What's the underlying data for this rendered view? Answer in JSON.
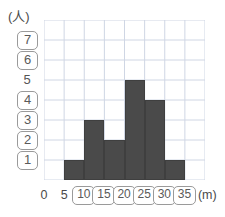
{
  "axes": {
    "y_unit_label": "(人)",
    "x_unit_label": "(m)",
    "y_ticks": [
      {
        "label": "7",
        "value": 7,
        "boxed": true
      },
      {
        "label": "6",
        "value": 6,
        "boxed": true
      },
      {
        "label": "5",
        "value": 5,
        "boxed": false
      },
      {
        "label": "4",
        "value": 4,
        "boxed": true
      },
      {
        "label": "3",
        "value": 3,
        "boxed": true
      },
      {
        "label": "2",
        "value": 2,
        "boxed": true
      },
      {
        "label": "1",
        "value": 1,
        "boxed": true
      }
    ],
    "x_ticks": [
      {
        "label": "0",
        "value": 0,
        "boxed": false
      },
      {
        "label": "5",
        "value": 5,
        "boxed": false
      },
      {
        "label": "10",
        "value": 10,
        "boxed": true
      },
      {
        "label": "15",
        "value": 15,
        "boxed": true
      },
      {
        "label": "20",
        "value": 20,
        "boxed": true
      },
      {
        "label": "25",
        "value": 25,
        "boxed": true
      },
      {
        "label": "30",
        "value": 30,
        "boxed": true
      },
      {
        "label": "35",
        "value": 35,
        "boxed": true
      }
    ]
  },
  "colors": {
    "bar_fill": "#4a4a4a",
    "bar_stroke": "#3f3f3f",
    "grid_line": "#cfd6e4",
    "label_box_border": "#9a9a9a",
    "text": "#4a4a4a",
    "background": "#ffffff"
  },
  "chart_data": {
    "type": "bar",
    "title": "",
    "xlabel": "(m)",
    "ylabel": "(人)",
    "grid": true,
    "legend": "none",
    "xlim": [
      0,
      40
    ],
    "ylim": [
      0,
      8
    ],
    "bin_width": 5,
    "categories": [
      "0-5",
      "5-10",
      "10-15",
      "15-20",
      "20-25",
      "25-30",
      "30-35",
      "35-40"
    ],
    "bin_starts": [
      0,
      5,
      10,
      15,
      20,
      25,
      30,
      35
    ],
    "values": [
      0,
      1,
      3,
      2,
      5,
      4,
      1,
      0
    ]
  }
}
